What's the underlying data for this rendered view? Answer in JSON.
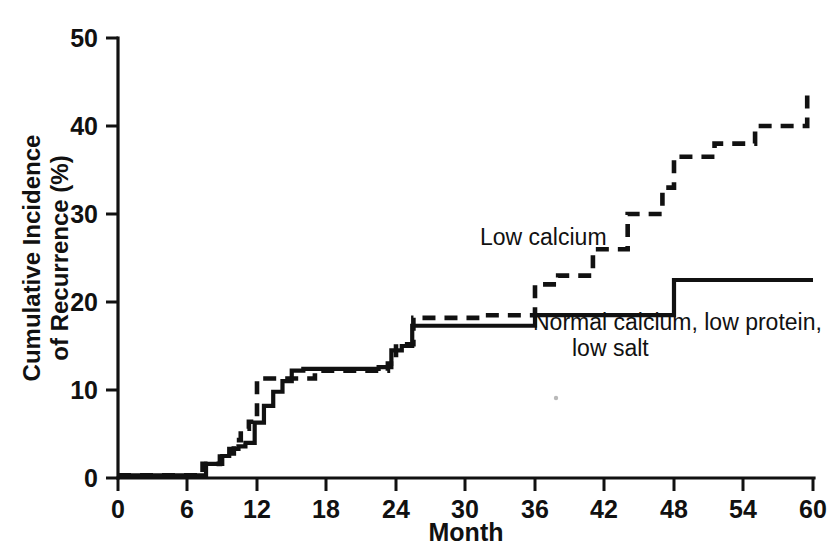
{
  "chart_data": {
    "type": "line",
    "subtype": "step-cumulative-incidence",
    "title": "",
    "subtitle": "",
    "xlabel": "Month",
    "ylabel": "Cumulative Incidence of Recurrence (%)",
    "ylabel_lines": [
      "Cumulative Incidence",
      "of Recurrence (%)"
    ],
    "xlim": [
      0,
      60
    ],
    "ylim": [
      0,
      50
    ],
    "xticks": [
      0,
      6,
      12,
      18,
      24,
      30,
      36,
      42,
      48,
      54,
      60
    ],
    "xticklabels": [
      "0",
      "6",
      "12",
      "18",
      "24",
      "30",
      "36",
      "42",
      "48",
      "54",
      "60"
    ],
    "yticks": [
      0,
      10,
      20,
      30,
      40,
      50
    ],
    "yticklabels": [
      "0",
      "10",
      "20",
      "30",
      "40",
      "50"
    ],
    "grid": false,
    "legend_position": "inline-annotations",
    "line_color": "#111111",
    "background_color": "#ffffff",
    "series": [
      {
        "name": "Low calcium",
        "style": "dashed",
        "annotation": "Low calcium",
        "x": [
          0,
          7.3,
          7.3,
          8.8,
          8.8,
          10.0,
          10.0,
          10.6,
          10.6,
          11.3,
          11.3,
          12.0,
          12.0,
          17.0,
          17.0,
          23.3,
          23.3,
          24.0,
          24.0,
          25.5,
          25.5,
          31.0,
          31.0,
          36.0,
          36.0,
          38.0,
          38.0,
          41.0,
          41.0,
          44.0,
          44.0,
          47.0,
          47.0,
          48.0,
          48.0,
          51.5,
          51.5,
          55.0,
          55.0,
          59.5,
          59.5,
          60.0
        ],
        "y": [
          0.3,
          0.3,
          1.6,
          1.6,
          2.8,
          2.8,
          4.3,
          4.3,
          5.6,
          5.6,
          6.4,
          6.4,
          11.3,
          11.3,
          12.2,
          12.2,
          13.0,
          13.0,
          15.2,
          15.2,
          18.2,
          18.2,
          18.5,
          18.5,
          22.0,
          22.0,
          23.0,
          23.0,
          26.0,
          26.0,
          30.0,
          30.0,
          33.0,
          33.0,
          36.5,
          36.5,
          38.0,
          38.0,
          40.0,
          40.0,
          43.5,
          43.5
        ],
        "endpoint_value": 43.5
      },
      {
        "name": "Normal calcium, low protein, low salt",
        "style": "solid",
        "annotation": "Normal calcium, low protein, low salt",
        "annotation_lines": [
          "Normal calcium, low protein,",
          "low salt"
        ],
        "x": [
          0,
          7.6,
          7.6,
          9.0,
          9.0,
          9.6,
          9.6,
          10.4,
          10.4,
          11.0,
          11.0,
          11.8,
          11.8,
          12.6,
          12.6,
          13.4,
          13.4,
          14.2,
          14.2,
          15.0,
          15.0,
          16.0,
          16.0,
          22.5,
          22.5,
          23.6,
          23.6,
          24.5,
          24.5,
          25.4,
          25.4,
          36.0,
          36.0,
          48.0,
          48.0,
          51.0,
          51.0,
          60.0
        ],
        "y": [
          0.3,
          0.3,
          1.6,
          1.6,
          2.5,
          2.5,
          3.3,
          3.3,
          3.6,
          3.6,
          4.0,
          4.0,
          6.3,
          6.3,
          8.2,
          8.2,
          9.8,
          9.8,
          11.0,
          11.0,
          12.2,
          12.2,
          12.4,
          12.4,
          12.6,
          12.6,
          14.5,
          14.5,
          15.0,
          15.0,
          17.3,
          17.3,
          18.5,
          18.5,
          22.5,
          22.5,
          22.5,
          22.5
        ],
        "endpoint_value": 22.5
      }
    ],
    "annotations": [
      {
        "text": "Low calcium",
        "x_month": 33.5,
        "y_percent": 26.8
      },
      {
        "text": "Normal calcium, low protein,",
        "x_month": 44.0,
        "y_percent": 16.2
      },
      {
        "text": "low salt",
        "x_month": 44.0,
        "y_percent": 14.0
      }
    ]
  }
}
